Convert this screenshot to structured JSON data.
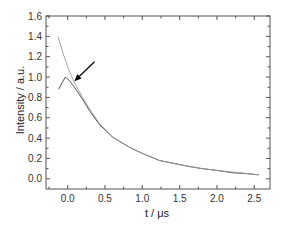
{
  "chart_data": {
    "type": "line",
    "title": "",
    "xlabel": "t / μs",
    "ylabel": "Intensity / a.u.",
    "xlim": [
      -0.29,
      2.71
    ],
    "ylim": [
      -0.1,
      1.6
    ],
    "xticks": [
      0.0,
      0.5,
      1.0,
      1.5,
      2.0,
      2.5
    ],
    "xtick_labels": [
      "0.0",
      "0.5",
      "1.0",
      "1.5",
      "2.0",
      "2.5"
    ],
    "yticks": [
      0.0,
      0.2,
      0.4,
      0.6,
      0.8,
      1.0,
      1.2,
      1.4,
      1.6
    ],
    "ytick_labels": [
      "0.0",
      "0.2",
      "0.4",
      "0.6",
      "0.8",
      "1.0",
      "1.2",
      "1.4",
      "1.6"
    ],
    "grid": false,
    "legend": null,
    "series": [
      {
        "name": "measured",
        "color": "#444444",
        "x": [
          -0.12,
          -0.07,
          -0.03,
          0.02,
          0.06,
          0.12,
          0.2,
          0.3,
          0.43,
          0.6,
          0.83,
          1.0,
          1.23,
          1.5,
          1.63,
          1.8,
          2.03,
          2.2,
          2.4,
          2.56
        ],
        "y": [
          0.88,
          0.95,
          1.0,
          0.97,
          0.93,
          0.87,
          0.78,
          0.66,
          0.53,
          0.41,
          0.31,
          0.25,
          0.18,
          0.14,
          0.12,
          0.1,
          0.08,
          0.06,
          0.05,
          0.04
        ]
      },
      {
        "name": "fit",
        "color": "#9a9a9a",
        "x": [
          -0.13,
          -0.05,
          0.0,
          0.1,
          0.2,
          0.3,
          0.43,
          0.6,
          0.83,
          1.0,
          1.23,
          1.5,
          1.8,
          2.03,
          2.3,
          2.56
        ],
        "y": [
          1.4,
          1.21,
          1.1,
          0.93,
          0.8,
          0.68,
          0.54,
          0.41,
          0.31,
          0.25,
          0.18,
          0.14,
          0.1,
          0.08,
          0.06,
          0.04
        ]
      }
    ],
    "annotations": [
      {
        "type": "arrow",
        "from": [
          0.36,
          1.15
        ],
        "to": [
          0.09,
          0.96
        ],
        "color": "#000000"
      }
    ]
  }
}
